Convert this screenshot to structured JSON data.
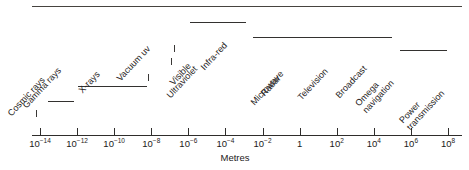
{
  "figure": {
    "title": "",
    "axis_title": "Metres",
    "axis": {
      "exponents": [
        -14,
        -12,
        -10,
        -8,
        -6,
        -4,
        -2,
        0,
        2,
        4,
        6,
        8
      ],
      "tick_labels": [
        "10⁻¹⁴",
        "10⁻¹²",
        "10⁻¹⁰",
        "10⁻⁸",
        "10⁻⁶",
        "10⁻⁴",
        "10⁻²",
        "1",
        "10²",
        "10⁴",
        "10⁶",
        "10⁸"
      ],
      "tick_mantissas": [
        "10",
        "10",
        "10",
        "10",
        "10",
        "10",
        "10",
        "1",
        "10",
        "10",
        "10",
        "10"
      ],
      "tick_exponents": [
        "-14",
        "-12",
        "-10",
        "-8",
        "-6",
        "-4",
        "-2",
        "",
        "2",
        "4",
        "6",
        "8"
      ]
    },
    "bands": [
      {
        "name": "cosmic-rays",
        "label_line1": "Cosmic rays",
        "label_line2": ""
      },
      {
        "name": "gamma-rays",
        "label_line1": "Gamma rays",
        "label_line2": ""
      },
      {
        "name": "x-rays",
        "label_line1": "X-rays",
        "label_line2": ""
      },
      {
        "name": "vacuum-uv",
        "label_line1": "Vacuum uv",
        "label_line2": ""
      },
      {
        "name": "ultraviolet",
        "label_line1": "Ultraviolet",
        "label_line2": ""
      },
      {
        "name": "visible",
        "label_line1": "Visible",
        "label_line2": ""
      },
      {
        "name": "infra-red",
        "label_line1": "Infra-red",
        "label_line2": ""
      },
      {
        "name": "microwave",
        "label_line1": "Microwave",
        "label_line2": ""
      },
      {
        "name": "radar",
        "label_line1": "Radar",
        "label_line2": ""
      },
      {
        "name": "television",
        "label_line1": "Television",
        "label_line2": ""
      },
      {
        "name": "broadcast",
        "label_line1": "Broadcast",
        "label_line2": ""
      },
      {
        "name": "omega-navigation",
        "label_line1": "Omega",
        "label_line2": "navigation"
      },
      {
        "name": "power-transmission",
        "label_line1": "Power",
        "label_line2": "transmission"
      }
    ]
  },
  "chart_data": {
    "type": "bar",
    "xlabel": "Metres",
    "ylabel": "",
    "xscale": "log10",
    "xlim": [
      -15,
      9
    ],
    "grid": false,
    "legend": null,
    "tick_values": [
      1e-14,
      1e-12,
      1e-10,
      1e-08,
      1e-06,
      0.0001,
      0.01,
      1,
      100.0,
      10000.0,
      1000000.0,
      100000000.0
    ],
    "tick_labels": [
      "10⁻¹⁴",
      "10⁻¹²",
      "10⁻¹⁰",
      "10⁻⁸",
      "10⁻⁶",
      "10⁻⁴",
      "10⁻²",
      "1",
      "10²",
      "10⁴",
      "10⁶",
      "10⁸"
    ],
    "categories": [
      "Cosmic rays",
      "Gamma rays",
      "X-rays",
      "Vacuum uv",
      "Ultraviolet",
      "Visible",
      "Infra-red",
      "Microwave / Radar",
      "Television",
      "Broadcast",
      "Omega navigation",
      "Power transmission"
    ],
    "bands": [
      {
        "label": "Cosmic rays",
        "start_exp": -15.0,
        "end_exp": -14.6,
        "marker": "tick"
      },
      {
        "label": "Gamma rays",
        "start_exp": -14.0,
        "end_exp": -12.6,
        "marker": "line"
      },
      {
        "label": "X-rays",
        "start_exp": -12.4,
        "end_exp": -8.8,
        "marker": "line"
      },
      {
        "label": "Vacuum uv",
        "start_exp": -8.6,
        "end_exp": -7.3,
        "marker": "tick"
      },
      {
        "label": "Ultraviolet",
        "start_exp": -7.1,
        "end_exp": -6.6,
        "marker": "tick"
      },
      {
        "label": "Visible",
        "start_exp": -6.5,
        "end_exp": -6.2,
        "marker": "tick"
      },
      {
        "label": "Infra-red",
        "start_exp": -5.8,
        "end_exp": -2.8,
        "marker": "line"
      },
      {
        "label": "Microwave / Radar / Television / Broadcast / Omega navigation",
        "start_exp": -2.6,
        "end_exp": 5.0,
        "marker": "line"
      },
      {
        "label": "Power transmission",
        "start_exp": 5.4,
        "end_exp": 7.9,
        "marker": "line"
      }
    ],
    "annotations": [
      "Top rule spans the full axis width",
      "Band labels are rotated approximately 47 degrees counter-clockwise"
    ]
  }
}
